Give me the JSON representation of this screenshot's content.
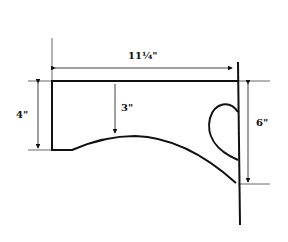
{
  "diagram": {
    "type": "dimensioned-shape-drawing",
    "dimensions": {
      "width": "11¼\"",
      "height_left": "4\"",
      "arc_depth": "3\"",
      "height_right": "6\""
    },
    "colors": {
      "line": "#111111",
      "background": "#ffffff"
    }
  }
}
